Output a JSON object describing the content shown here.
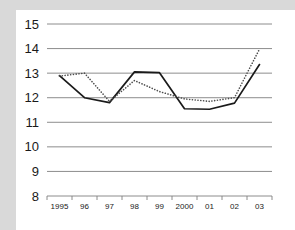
{
  "chart_data": {
    "type": "line",
    "title": "",
    "subtitle": "",
    "xlabel": "",
    "ylabel": "",
    "categories": [
      "1995",
      "96",
      "97",
      "98",
      "99",
      "2000",
      "01",
      "02",
      "03"
    ],
    "x_tick_labels": [
      "1995",
      "96",
      "97",
      "98",
      "99",
      "2000",
      "01",
      "02",
      "03"
    ],
    "y_tick_labels": [
      "15",
      "14",
      "13",
      "12",
      "11",
      "10",
      "9",
      "8"
    ],
    "y_ticks": [
      15,
      14,
      13,
      12,
      11,
      10,
      9,
      8
    ],
    "ylim": [
      8,
      15
    ],
    "xlim": [
      0,
      9
    ],
    "grid": true,
    "grid_axis": "y",
    "legend": false,
    "legend_position": "none",
    "series": [
      {
        "name": "solid-series",
        "style": "solid",
        "color": "#1a1a1a",
        "values": [
          12.9,
          12.0,
          11.8,
          13.05,
          13.02,
          11.55,
          11.53,
          11.78,
          13.35
        ]
      },
      {
        "name": "dotted-series",
        "style": "dotted",
        "color": "#4d4d4d",
        "values": [
          12.88,
          13.0,
          11.85,
          12.7,
          12.25,
          11.95,
          11.85,
          12.0,
          13.98
        ]
      }
    ]
  },
  "figure": {
    "background_color": "#d9d9d9",
    "panel_color": "#ffffff",
    "grid_color": "#808080",
    "axis_color": "#808080",
    "text_color": "#1a1a1a"
  }
}
